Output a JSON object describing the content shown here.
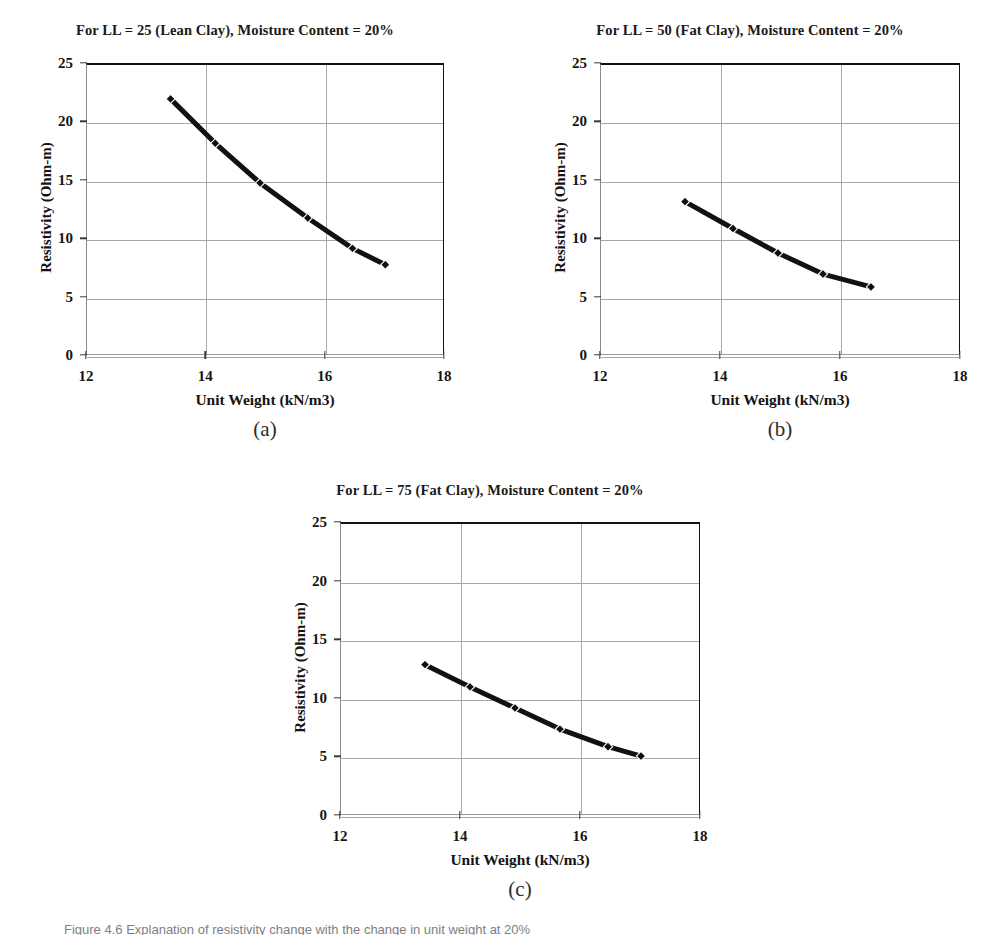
{
  "figure": {
    "caption": "Figure 4.6  Explanation of resistivity change with the change in unit weight at 20%"
  },
  "axis": {
    "xlabel": "Unit Weight (kN/m3)",
    "ylabel": "Resistivity (Ohm-m)",
    "xticks": [
      "12",
      "14",
      "16",
      "18"
    ],
    "yticks": [
      "0",
      "5",
      "10",
      "15",
      "20",
      "25"
    ],
    "xlim": [
      12,
      18
    ],
    "ylim": [
      0,
      25
    ]
  },
  "panels": [
    {
      "letter": "(a)",
      "title": "For LL = 25 (Lean Clay), Moisture Content = 20%"
    },
    {
      "letter": "(b)",
      "title": "For LL = 50 (Fat Clay), Moisture Content = 20%"
    },
    {
      "letter": "(c)",
      "title": "For LL = 75 (Fat Clay), Moisture Content = 20%"
    }
  ],
  "style": {
    "line_color": "#111111",
    "marker_color": "#101010",
    "grid_color": "#a8a8a8",
    "text_color": "#161616"
  },
  "chart_data": [
    {
      "type": "line",
      "title": "For LL = 25 (Lean Clay), Moisture Content = 20%",
      "panel": "(a)",
      "xlabel": "Unit Weight (kN/m3)",
      "ylabel": "Resistivity (Ohm-m)",
      "xlim": [
        12,
        18
      ],
      "ylim": [
        0,
        25
      ],
      "xticks": [
        12,
        14,
        16,
        18
      ],
      "yticks": [
        0,
        5,
        10,
        15,
        20,
        25
      ],
      "grid": true,
      "legend": "none",
      "series": [
        {
          "name": "LL = 25 (Lean Clay)",
          "x": [
            13.4,
            14.15,
            14.9,
            15.7,
            16.45,
            17.0
          ],
          "values": [
            22.1,
            18.3,
            14.9,
            11.9,
            9.3,
            7.9
          ]
        }
      ]
    },
    {
      "type": "line",
      "title": "For LL = 50 (Fat Clay), Moisture Content = 20%",
      "panel": "(b)",
      "xlabel": "Unit Weight (kN/m3)",
      "ylabel": "Resistivity (Ohm-m)",
      "xlim": [
        12,
        18
      ],
      "ylim": [
        0,
        25
      ],
      "xticks": [
        12,
        14,
        16,
        18
      ],
      "yticks": [
        0,
        5,
        10,
        15,
        20,
        25
      ],
      "grid": true,
      "legend": "none",
      "series": [
        {
          "name": "LL = 50 (Fat Clay)",
          "x": [
            13.4,
            14.2,
            14.95,
            15.7,
            16.5
          ],
          "values": [
            13.3,
            11.0,
            8.9,
            7.1,
            6.0
          ]
        }
      ]
    },
    {
      "type": "line",
      "title": "For LL = 75 (Fat Clay), Moisture Content = 20%",
      "panel": "(c)",
      "xlabel": "Unit Weight (kN/m3)",
      "ylabel": "Resistivity (Ohm-m)",
      "xlim": [
        12,
        18
      ],
      "ylim": [
        0,
        25
      ],
      "xticks": [
        12,
        14,
        16,
        18
      ],
      "yticks": [
        0,
        5,
        10,
        15,
        20,
        25
      ],
      "grid": true,
      "legend": "none",
      "series": [
        {
          "name": "LL = 75 (Fat Clay)",
          "x": [
            13.4,
            14.15,
            14.9,
            15.65,
            16.45,
            17.0
          ],
          "values": [
            13.0,
            11.1,
            9.3,
            7.5,
            6.0,
            5.2
          ]
        }
      ]
    }
  ]
}
